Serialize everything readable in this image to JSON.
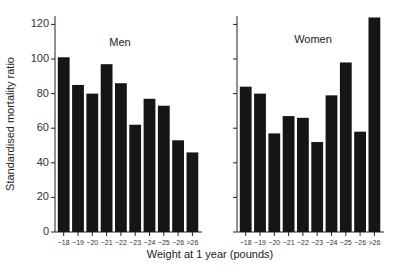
{
  "chart_data": {
    "type": "bar",
    "title": "",
    "xlabel": "Weight at 1 year (pounds)",
    "ylabel": "Standardised mortality ratio",
    "ylim": [
      0,
      125
    ],
    "yticks": [
      0,
      20,
      40,
      60,
      80,
      100,
      120
    ],
    "grid": false,
    "legend": null,
    "categories": [
      "−18",
      "−19",
      "−20",
      "−21",
      "−22",
      "−23",
      "−24",
      "−25",
      "−26",
      ">26"
    ],
    "panels": [
      {
        "name": "Men",
        "values": [
          101,
          85,
          80,
          97,
          86,
          62,
          77,
          73,
          53,
          46
        ]
      },
      {
        "name": "Women",
        "values": [
          84,
          80,
          57,
          67,
          66,
          52,
          79,
          98,
          58,
          124
        ]
      }
    ]
  },
  "labels": {
    "men": "Men",
    "women": "Women",
    "xlabel": "Weight at 1 year (pounds)",
    "ylabel": "Standardised mortality ratio"
  }
}
